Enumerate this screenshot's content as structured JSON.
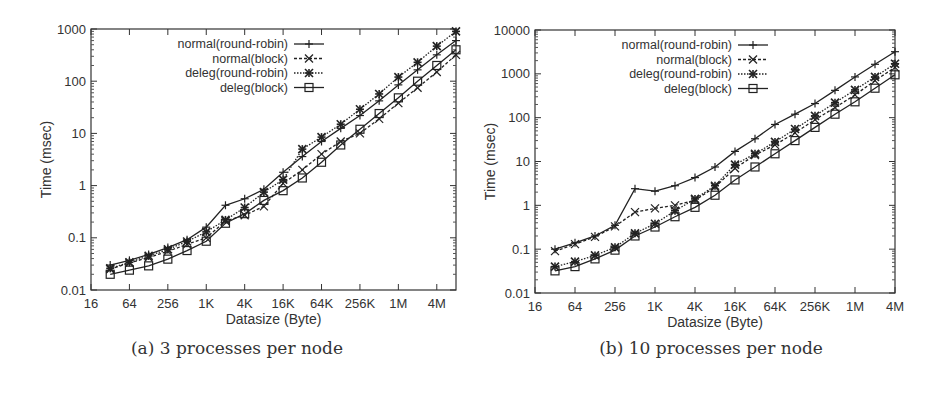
{
  "figure": {
    "panels": [
      {
        "caption": "(a) 3 processes per node"
      },
      {
        "caption": "(b) 10 processes per node"
      }
    ]
  },
  "chart_data": [
    {
      "type": "line",
      "title": "(a) 3 processes per node",
      "xlabel": "Datasize (Byte)",
      "ylabel": "Time (msec)",
      "xscale": "log2",
      "yscale": "log10",
      "ylim": [
        0.01,
        1000
      ],
      "xlim": [
        16,
        8388608
      ],
      "x_tick_labels": [
        "16",
        "64",
        "256",
        "1K",
        "4K",
        "16K",
        "64K",
        "256K",
        "1M",
        "4M"
      ],
      "y_tick_labels": [
        "0.01",
        "0.1",
        "1",
        "10",
        "100",
        "1000"
      ],
      "grid": false,
      "legend_position": "top-left",
      "x": [
        32,
        64,
        128,
        256,
        512,
        1024,
        2048,
        4096,
        8192,
        16384,
        32768,
        65536,
        131072,
        262144,
        524288,
        1048576,
        2097152,
        4194304,
        8388608
      ],
      "series": [
        {
          "name": "normal(round-robin)",
          "marker": "plus",
          "line": "solid",
          "values": [
            0.03,
            0.037,
            0.048,
            0.065,
            0.092,
            0.16,
            0.42,
            0.56,
            0.85,
            1.8,
            3.6,
            7.0,
            12.5,
            22,
            42,
            85,
            165,
            320,
            600
          ]
        },
        {
          "name": "normal(block)",
          "marker": "x",
          "line": "dashed",
          "values": [
            0.025,
            0.033,
            0.042,
            0.055,
            0.075,
            0.1,
            0.21,
            0.27,
            0.4,
            1.1,
            2.0,
            4.0,
            7.0,
            10,
            19,
            38,
            75,
            150,
            320
          ]
        },
        {
          "name": "deleg(round-robin)",
          "marker": "asterisk",
          "line": "dotted",
          "values": [
            0.026,
            0.034,
            0.045,
            0.06,
            0.085,
            0.13,
            0.22,
            0.38,
            0.75,
            1.3,
            5.0,
            8.5,
            15,
            29,
            57,
            120,
            230,
            470,
            900
          ]
        },
        {
          "name": "deleg(block)",
          "marker": "square",
          "line": "solid",
          "values": [
            0.02,
            0.024,
            0.029,
            0.039,
            0.057,
            0.086,
            0.19,
            0.29,
            0.52,
            0.8,
            1.4,
            2.8,
            6.0,
            12,
            24,
            48,
            100,
            200,
            400
          ]
        }
      ]
    },
    {
      "type": "line",
      "title": "(b) 10 processes per node",
      "xlabel": "Datasize (Byte)",
      "ylabel": "Time (msec)",
      "xscale": "log2",
      "yscale": "log10",
      "ylim": [
        0.01,
        10000
      ],
      "xlim": [
        16,
        4194304
      ],
      "x_tick_labels": [
        "16",
        "64",
        "256",
        "1K",
        "4K",
        "16K",
        "64K",
        "256K",
        "1M",
        "4M"
      ],
      "y_tick_labels": [
        "0.01",
        "0.1",
        "1",
        "10",
        "100",
        "1000",
        "10000"
      ],
      "grid": false,
      "legend_position": "top-left",
      "x": [
        32,
        64,
        128,
        256,
        512,
        1024,
        2048,
        4096,
        8192,
        16384,
        32768,
        65536,
        131072,
        262144,
        524288,
        1048576,
        2097152,
        4194304
      ],
      "series": [
        {
          "name": "normal(round-robin)",
          "marker": "plus",
          "line": "solid",
          "values": [
            0.1,
            0.14,
            0.2,
            0.35,
            2.4,
            2.1,
            2.8,
            4.3,
            7.5,
            17,
            33,
            70,
            120,
            210,
            420,
            850,
            1650,
            3200
          ]
        },
        {
          "name": "normal(block)",
          "marker": "x",
          "line": "dashed",
          "values": [
            0.09,
            0.13,
            0.19,
            0.33,
            0.7,
            0.85,
            1.0,
            1.3,
            2.6,
            7.0,
            14,
            24,
            45,
            90,
            170,
            330,
            700,
            1400
          ]
        },
        {
          "name": "deleg(round-robin)",
          "marker": "asterisk",
          "line": "dotted",
          "values": [
            0.04,
            0.052,
            0.072,
            0.11,
            0.23,
            0.38,
            0.75,
            1.4,
            2.8,
            8.5,
            15,
            28,
            55,
            110,
            220,
            430,
            850,
            1700
          ]
        },
        {
          "name": "deleg(block)",
          "marker": "square",
          "line": "solid",
          "values": [
            0.032,
            0.04,
            0.06,
            0.095,
            0.2,
            0.32,
            0.55,
            0.9,
            1.7,
            3.8,
            7.5,
            15,
            30,
            60,
            120,
            230,
            470,
            950
          ]
        }
      ]
    }
  ]
}
